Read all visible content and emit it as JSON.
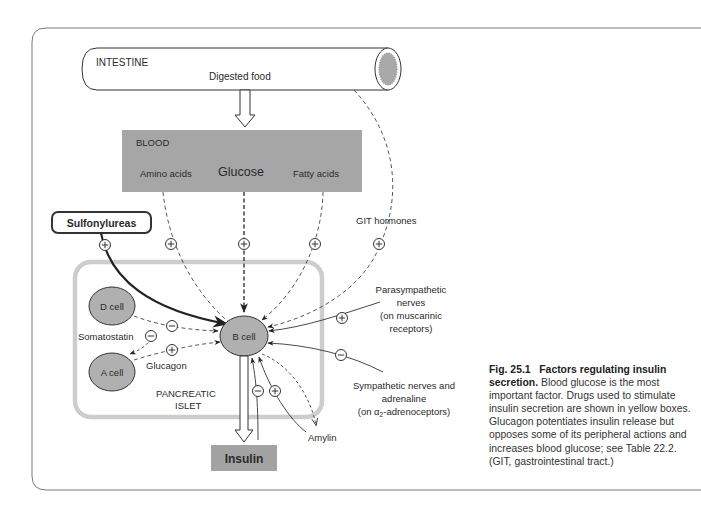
{
  "figure": {
    "intestine": {
      "title": "INTESTINE",
      "sublabel": "Digested food"
    },
    "blood": {
      "title": "BLOOD",
      "nutrients": [
        "Amino acids",
        "Glucose",
        "Fatty acids"
      ]
    },
    "git_hormones": "GIT hormones",
    "drug_box": "Sulfonylureas",
    "islet": {
      "label_lines": [
        "PANCREATIC",
        "ISLET"
      ],
      "cells": {
        "d_cell": "D cell",
        "a_cell": "A cell",
        "b_cell": "B cell"
      },
      "somatostatin": "Somatostatin",
      "glucagon": "Glucagon"
    },
    "parasympathetic": [
      "Parasympathetic",
      "nerves",
      "(on muscarinic",
      "receptors)"
    ],
    "sympathetic": [
      "Sympathetic nerves and",
      "adrenaline",
      "(on α",
      "2",
      "-adrenoceptors)"
    ],
    "amylin": "Amylin",
    "insulin": "Insulin",
    "signs": {
      "plus": "+",
      "minus": "−"
    },
    "colors": {
      "blood_box": "#a6a6a6",
      "islet_border": "#cdcdcd",
      "cell_fill": "#b0b0b0",
      "insulin_box": "#a3a3a3",
      "lumen": "#a9a9a9"
    }
  },
  "caption": {
    "fig_number": "Fig. 25.1",
    "title": "Factors regulating insulin secretion.",
    "body": "Blood glucose is the most important factor. Drugs used to stimulate insulin secretion are shown in yellow boxes. Glucagon potentiates insulin release but opposes some of its peripheral actions and increases blood glucose; see Table 22.2. (GIT, gastrointestinal tract.)"
  }
}
